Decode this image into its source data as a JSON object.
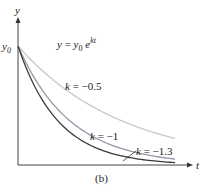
{
  "chart_data": {
    "type": "line",
    "caption": "(b)",
    "xlabel": "t",
    "ylabel": "y",
    "y_tick_labels": [
      "y0"
    ],
    "formula": {
      "lhs": "y",
      "eq": "=",
      "base": "y",
      "sub": "0",
      "e": "e",
      "exp": "kt"
    },
    "x_range": [
      0,
      3
    ],
    "y_range": [
      0,
      1
    ],
    "grid": false,
    "series": [
      {
        "name": "k = -0.5",
        "k": -0.5,
        "color": "#c8c8c8",
        "x": [
          0,
          0.5,
          1,
          1.5,
          2,
          2.5,
          3
        ],
        "values": [
          1,
          0.78,
          0.61,
          0.47,
          0.37,
          0.29,
          0.22
        ]
      },
      {
        "name": "k = -1",
        "k": -1,
        "color": "#9a93a8",
        "x": [
          0,
          0.5,
          1,
          1.5,
          2,
          2.5,
          3
        ],
        "values": [
          1,
          0.61,
          0.37,
          0.22,
          0.14,
          0.08,
          0.05
        ]
      },
      {
        "name": "k = -1.3",
        "k": -1.3,
        "color": "#3a3a3a",
        "x": [
          0,
          0.5,
          1,
          1.5,
          2,
          2.5,
          3
        ],
        "values": [
          1,
          0.52,
          0.27,
          0.14,
          0.07,
          0.04,
          0.02
        ]
      }
    ],
    "labels": {
      "k_half": {
        "k": "k",
        "rest": " = −0.5"
      },
      "k_one": {
        "k": "k",
        "rest": " = −1"
      },
      "k_onethree": {
        "k": "k",
        "rest": " = −1.3"
      }
    }
  }
}
